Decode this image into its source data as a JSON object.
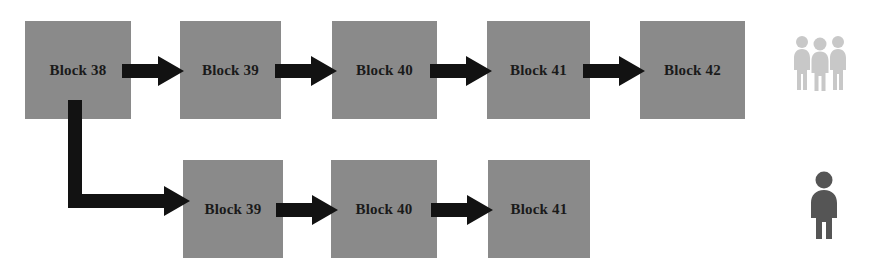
{
  "diagram": {
    "colors": {
      "block_fill": "#8a8a8a",
      "block_text": "#1a1a1a",
      "arrow": "#121212",
      "background": "#ffffff",
      "group_people_icon": "#c8c8c8",
      "single_person_icon": "#555555"
    },
    "main_chain": {
      "name": "main-chain",
      "blocks": [
        {
          "label": "Block 38",
          "x": 25,
          "y": 21,
          "w": 106,
          "h": 98
        },
        {
          "label": "Block 39",
          "x": 180,
          "y": 21,
          "w": 101,
          "h": 98
        },
        {
          "label": "Block 40",
          "x": 332,
          "y": 21,
          "w": 105,
          "h": 98
        },
        {
          "label": "Block 41",
          "x": 487,
          "y": 21,
          "w": 103,
          "h": 98
        },
        {
          "label": "Block 42",
          "x": 640,
          "y": 21,
          "w": 105,
          "h": 98
        }
      ],
      "arrows": [
        {
          "name": "arrow-block38-to-block39",
          "x": 122,
          "y": 56,
          "w": 62,
          "h": 30
        },
        {
          "name": "arrow-block39-to-block40",
          "x": 275,
          "y": 56,
          "w": 62,
          "h": 30
        },
        {
          "name": "arrow-block40-to-block41",
          "x": 430,
          "y": 56,
          "w": 62,
          "h": 30
        },
        {
          "name": "arrow-block41-to-block42",
          "x": 583,
          "y": 56,
          "w": 62,
          "h": 30
        }
      ]
    },
    "fork_chain": {
      "name": "fork-chain",
      "blocks": [
        {
          "label": "Block 39",
          "x": 183,
          "y": 160,
          "w": 100,
          "h": 98
        },
        {
          "label": "Block 40",
          "x": 331,
          "y": 160,
          "w": 106,
          "h": 98
        },
        {
          "label": "Block 41",
          "x": 488,
          "y": 160,
          "w": 102,
          "h": 98
        }
      ],
      "arrows": [
        {
          "name": "arrow-fork-block39-to-block40",
          "x": 276,
          "y": 195,
          "w": 62,
          "h": 30
        },
        {
          "name": "arrow-fork-block40-to-block41",
          "x": 431,
          "y": 195,
          "w": 62,
          "h": 30
        }
      ],
      "fork_connector": {
        "name": "fork-branch-connector",
        "from_block": "Block 38",
        "to_block": "Block 39",
        "x": 66,
        "y": 100,
        "w": 126,
        "h": 124
      }
    },
    "actors": [
      {
        "name": "majority-miners-icon",
        "icon": "group-of-three-people-icon",
        "count": 3,
        "color": "#c8c8c8",
        "x": 793,
        "y": 34,
        "w": 54,
        "h": 58
      },
      {
        "name": "minority-miner-icon",
        "icon": "single-person-icon",
        "count": 1,
        "color": "#555555",
        "x": 808,
        "y": 170,
        "w": 32,
        "h": 70
      }
    ]
  }
}
